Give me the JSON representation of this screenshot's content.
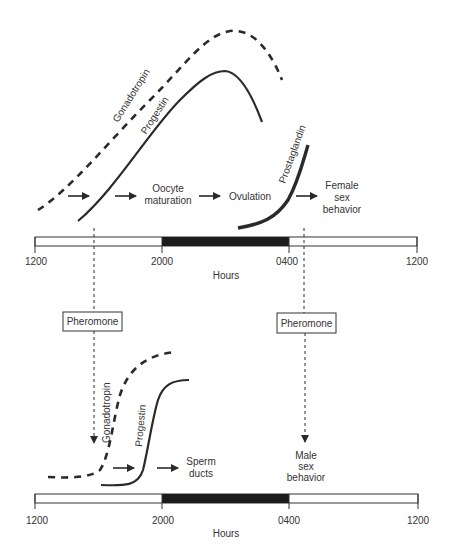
{
  "diagram": {
    "female_panel": {
      "curves": [
        {
          "name": "Gonadotropin",
          "style": "dashed"
        },
        {
          "name": "Progestin",
          "style": "solid"
        },
        {
          "name": "Prostaglandin",
          "style": "solid-thick"
        }
      ],
      "events": [
        "Oocyte maturation",
        "Ovulation",
        "Female sex behavior"
      ],
      "labels": {
        "gonadotropin": "Gonadotropin",
        "progestin": "Progestin",
        "prostaglandin": "Prostaglandin",
        "oocyte_line1": "Oocyte",
        "oocyte_line2": "maturation",
        "ovulation": "Ovulation",
        "female_line1": "Female",
        "female_line2": "sex",
        "female_line3": "behavior"
      },
      "axis": {
        "ticks": [
          "1200",
          "2000",
          "0400",
          "1200"
        ],
        "xlabel": "Hours",
        "dark_period": [
          "2000",
          "0400"
        ]
      }
    },
    "pheromones": {
      "left": "Pheromone",
      "right": "Pheromone"
    },
    "male_panel": {
      "curves": [
        {
          "name": "Gonadotropin",
          "style": "dashed"
        },
        {
          "name": "Progestin",
          "style": "solid"
        }
      ],
      "events": [
        "Sperm ducts",
        "Male sex behavior"
      ],
      "labels": {
        "gonadotropin": "Gonadotropin",
        "progestin": "Progestin",
        "sperm_line1": "Sperm",
        "sperm_line2": "ducts",
        "male_line1": "Male",
        "male_line2": "sex",
        "male_line3": "behavior"
      },
      "axis": {
        "ticks": [
          "1200",
          "2000",
          "0400",
          "1200"
        ],
        "xlabel": "Hours",
        "dark_period": [
          "2000",
          "0400"
        ]
      }
    }
  }
}
